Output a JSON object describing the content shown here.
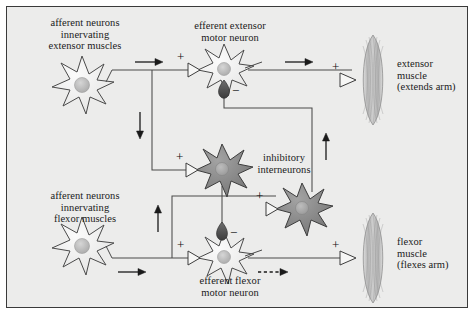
{
  "figure": {
    "background_color": "#ececeb",
    "border_color": "#3a3a3a",
    "width": 476,
    "height": 316
  },
  "labels": {
    "afferent_extensor": "afferent neurons\ninnervating\nextensor muscles",
    "efferent_extensor": "efferent extensor\nmotor neuron",
    "extensor_muscle": "extensor\nmuscle\n(extends arm)",
    "inhibitory_interneurons": "inhibitory\ninterneurons",
    "afferent_flexor": "afferent neurons\ninnervating\nflexor muscles",
    "efferent_flexor": "efferent flexor\nmotor neuron",
    "flexor_muscle": "flexor\nmuscle\n(flexes arm)"
  },
  "synapse_signs": {
    "extensor_motor_excitatory": "+",
    "extensor_motor_inhibitory": "−",
    "extensor_muscle_junction": "+",
    "upper_interneuron_excitatory": "+",
    "lower_interneuron_excitatory": "+",
    "flexor_motor_excitatory": "+",
    "flexor_motor_inhibitory": "−",
    "flexor_muscle_junction": "+"
  },
  "colors": {
    "afferent_soma_fill": "#f7f7f6",
    "afferent_soma_stroke": "#4a4a4a",
    "nucleus_fill": "#b9b9b9",
    "interneuron_soma_fill": "#8a8a8a",
    "interneuron_soma_stroke": "#3d3d3d",
    "interneuron_nucleus": "#a9a9a9",
    "inhibitory_terminal_fill": "#5a5a5a",
    "muscle_fill": "#c9c9c9",
    "muscle_stroke": "#8f8f8f",
    "wire_stroke": "#4a4a4a",
    "arrow_fill": "#1a1a1a",
    "text_color": "#1a1a1a"
  },
  "neurons": [
    {
      "name": "afferent-extensor-neuron",
      "type": "afferent",
      "cx": 82,
      "cy": 86
    },
    {
      "name": "efferent-extensor-motor-neuron",
      "type": "afferent",
      "cx": 224,
      "cy": 70
    },
    {
      "name": "inhibitory-interneuron-upper",
      "type": "interneuron",
      "cx": 222,
      "cy": 170
    },
    {
      "name": "inhibitory-interneuron-lower",
      "type": "interneuron",
      "cx": 302,
      "cy": 209
    },
    {
      "name": "afferent-flexor-neuron",
      "type": "afferent",
      "cx": 82,
      "cy": 247
    },
    {
      "name": "efferent-flexor-motor-neuron",
      "type": "afferent",
      "cx": 224,
      "cy": 250
    }
  ],
  "muscles": [
    {
      "name": "extensor-muscle-shape",
      "cx": 373,
      "cy": 80,
      "rx": 13,
      "ry": 45
    },
    {
      "name": "flexor-muscle-shape",
      "cx": 373,
      "cy": 258,
      "rx": 13,
      "ry": 45
    }
  ],
  "flow_arrows": [
    {
      "name": "extensor-afferent-flow-arrow",
      "direction": "right",
      "x": 148,
      "y": 70
    },
    {
      "name": "extensor-branch-down-arrow",
      "direction": "down",
      "x": 152,
      "y": 128
    },
    {
      "name": "extensor-motor-output-arrow",
      "direction": "right",
      "x": 293,
      "y": 70
    },
    {
      "name": "flexor-afferent-flow-arrow",
      "direction": "right",
      "x": 132,
      "y": 258
    },
    {
      "name": "flexor-branch-up-arrow",
      "direction": "up",
      "x": 172,
      "y": 215
    },
    {
      "name": "right-return-up-arrow",
      "direction": "up",
      "x": 312,
      "y": 145
    },
    {
      "name": "flexor-motor-output-arrow",
      "direction": "right-dashed",
      "x": 268,
      "y": 258
    }
  ]
}
